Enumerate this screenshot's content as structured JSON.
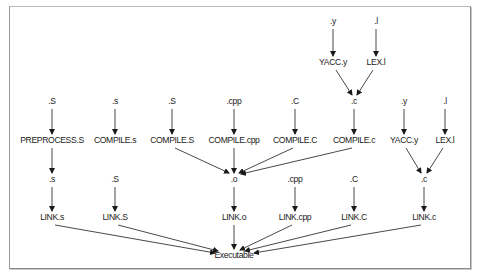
{
  "diagram": {
    "nodes": [
      {
        "id": "y_top",
        "label": ".y",
        "x": 333,
        "y": 24
      },
      {
        "id": "l_top",
        "label": ".l",
        "x": 376,
        "y": 24
      },
      {
        "id": "yacc_top",
        "label": "YACC.y",
        "x": 333,
        "y": 65
      },
      {
        "id": "lex_top",
        "label": "LEX.l",
        "x": 376,
        "y": 65
      },
      {
        "id": "S_src",
        "label": ".S",
        "x": 52,
        "y": 104
      },
      {
        "id": "s_src",
        "label": ".s",
        "x": 115,
        "y": 104
      },
      {
        "id": "S2_src",
        "label": ".S",
        "x": 172,
        "y": 104
      },
      {
        "id": "cpp_src",
        "label": ".cpp",
        "x": 234,
        "y": 104
      },
      {
        "id": "C_src",
        "label": ".C",
        "x": 295,
        "y": 104
      },
      {
        "id": "c_mid",
        "label": ".c",
        "x": 354,
        "y": 104
      },
      {
        "id": "y_mid",
        "label": ".y",
        "x": 404,
        "y": 104
      },
      {
        "id": "l_mid",
        "label": ".l",
        "x": 445,
        "y": 104
      },
      {
        "id": "preprocess_S",
        "label": "PREPROCESS.S",
        "x": 52,
        "y": 143
      },
      {
        "id": "compile_s",
        "label": "COMPILE.s",
        "x": 115,
        "y": 143
      },
      {
        "id": "compile_S",
        "label": "COMPILE.S",
        "x": 172,
        "y": 143
      },
      {
        "id": "compile_cpp",
        "label": "COMPILE.cpp",
        "x": 234,
        "y": 143
      },
      {
        "id": "compile_C",
        "label": "COMPILE.C",
        "x": 295,
        "y": 143
      },
      {
        "id": "compile_c",
        "label": "COMPILE.c",
        "x": 354,
        "y": 143
      },
      {
        "id": "yacc_mid",
        "label": "YACC.y",
        "x": 404,
        "y": 143
      },
      {
        "id": "lex_mid",
        "label": "LEX.l",
        "x": 445,
        "y": 143
      },
      {
        "id": "s_out",
        "label": ".s",
        "x": 52,
        "y": 182
      },
      {
        "id": "S_out",
        "label": ".S",
        "x": 115,
        "y": 182
      },
      {
        "id": "o_out",
        "label": ".o",
        "x": 234,
        "y": 182
      },
      {
        "id": "cpp_out",
        "label": ".cpp",
        "x": 295,
        "y": 182
      },
      {
        "id": "C_out",
        "label": ".C",
        "x": 354,
        "y": 182
      },
      {
        "id": "c_out",
        "label": ".c",
        "x": 424,
        "y": 182
      },
      {
        "id": "link_s",
        "label": "LINK.s",
        "x": 52,
        "y": 220
      },
      {
        "id": "link_S",
        "label": "LINK.S",
        "x": 115,
        "y": 220
      },
      {
        "id": "link_o",
        "label": "LINK.o",
        "x": 234,
        "y": 220
      },
      {
        "id": "link_cpp",
        "label": "LINK.cpp",
        "x": 295,
        "y": 220
      },
      {
        "id": "link_C",
        "label": "LINK.C",
        "x": 354,
        "y": 220
      },
      {
        "id": "link_c",
        "label": "LINK.c",
        "x": 424,
        "y": 220
      },
      {
        "id": "executable",
        "label": "Executable",
        "x": 234,
        "y": 258
      }
    ],
    "edges": [
      {
        "x1": 333,
        "y1": 29,
        "x2": 333,
        "y2": 56
      },
      {
        "x1": 376,
        "y1": 29,
        "x2": 376,
        "y2": 56
      },
      {
        "x1": 336,
        "y1": 70,
        "x2": 352,
        "y2": 95
      },
      {
        "x1": 373,
        "y1": 70,
        "x2": 357,
        "y2": 95
      },
      {
        "x1": 52,
        "y1": 109,
        "x2": 52,
        "y2": 134
      },
      {
        "x1": 115,
        "y1": 109,
        "x2": 115,
        "y2": 134
      },
      {
        "x1": 172,
        "y1": 109,
        "x2": 172,
        "y2": 134
      },
      {
        "x1": 234,
        "y1": 109,
        "x2": 234,
        "y2": 134
      },
      {
        "x1": 295,
        "y1": 109,
        "x2": 295,
        "y2": 134
      },
      {
        "x1": 354,
        "y1": 109,
        "x2": 354,
        "y2": 134
      },
      {
        "x1": 404,
        "y1": 109,
        "x2": 404,
        "y2": 134
      },
      {
        "x1": 445,
        "y1": 109,
        "x2": 445,
        "y2": 134
      },
      {
        "x1": 52,
        "y1": 148,
        "x2": 52,
        "y2": 173
      },
      {
        "x1": 175,
        "y1": 148,
        "x2": 229,
        "y2": 173
      },
      {
        "x1": 234,
        "y1": 148,
        "x2": 234,
        "y2": 173
      },
      {
        "x1": 293,
        "y1": 148,
        "x2": 239,
        "y2": 173
      },
      {
        "x1": 352,
        "y1": 148,
        "x2": 241,
        "y2": 174
      },
      {
        "x1": 406,
        "y1": 148,
        "x2": 421,
        "y2": 173
      },
      {
        "x1": 443,
        "y1": 148,
        "x2": 427,
        "y2": 173
      },
      {
        "x1": 52,
        "y1": 187,
        "x2": 52,
        "y2": 211
      },
      {
        "x1": 115,
        "y1": 187,
        "x2": 115,
        "y2": 211
      },
      {
        "x1": 234,
        "y1": 187,
        "x2": 234,
        "y2": 211
      },
      {
        "x1": 295,
        "y1": 187,
        "x2": 295,
        "y2": 211
      },
      {
        "x1": 354,
        "y1": 187,
        "x2": 354,
        "y2": 211
      },
      {
        "x1": 424,
        "y1": 187,
        "x2": 424,
        "y2": 211
      },
      {
        "x1": 55,
        "y1": 225,
        "x2": 215,
        "y2": 253
      },
      {
        "x1": 118,
        "y1": 225,
        "x2": 218,
        "y2": 251
      },
      {
        "x1": 234,
        "y1": 225,
        "x2": 234,
        "y2": 249
      },
      {
        "x1": 292,
        "y1": 225,
        "x2": 240,
        "y2": 250
      },
      {
        "x1": 351,
        "y1": 225,
        "x2": 245,
        "y2": 251
      },
      {
        "x1": 421,
        "y1": 225,
        "x2": 254,
        "y2": 253
      }
    ]
  }
}
